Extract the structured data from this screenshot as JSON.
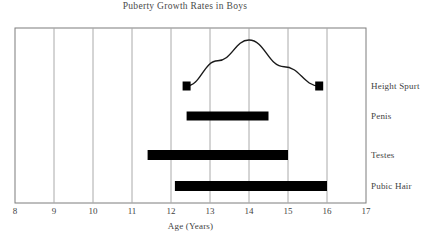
{
  "chart_data": {
    "type": "bar",
    "title": "Puberty Growth Rates in Boys",
    "xlabel": "Age (Years)",
    "ylabel": "",
    "xlim": [
      8,
      17
    ],
    "xticks": [
      8,
      9,
      10,
      11,
      12,
      13,
      14,
      15,
      16,
      17
    ],
    "xtick_labels": [
      "8",
      "9",
      "10",
      "11",
      "12",
      "13",
      "14",
      "15",
      "16",
      "17"
    ],
    "grid": "vertical",
    "legend_position": "right-labels",
    "orientation": "horizontal",
    "categories": [
      "Height Spurt",
      "Penis",
      "Testes",
      "Pubic Hair"
    ],
    "series": [
      {
        "name": "Height Spurt",
        "type": "line",
        "marker": "square",
        "row": 0,
        "start": 12.4,
        "end": 15.8,
        "peak": 14.0,
        "points": [
          {
            "x": 12.4,
            "y": 0.0
          },
          {
            "x": 13.2,
            "y": 0.55
          },
          {
            "x": 14.0,
            "y": 1.0
          },
          {
            "x": 14.9,
            "y": 0.42
          },
          {
            "x": 15.8,
            "y": 0.0
          }
        ]
      },
      {
        "name": "Penis",
        "type": "bar",
        "row": 1,
        "start": 12.4,
        "end": 14.5
      },
      {
        "name": "Testes",
        "type": "bar",
        "row": 2,
        "start": 11.4,
        "end": 15.0
      },
      {
        "name": "Pubic Hair",
        "type": "bar",
        "row": 3,
        "start": 12.1,
        "end": 16.0
      }
    ],
    "colors": {
      "bar": "#000000",
      "line": "#1a1a1a",
      "grid": "#aaaaaa",
      "axis": "#777777",
      "text": "#3f3f3f"
    }
  }
}
